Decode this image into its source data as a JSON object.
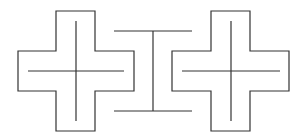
{
  "diagram": {
    "stroke_color": "#333333",
    "background": "#ffffff",
    "shapes": [
      {
        "type": "cross-outline",
        "name": "left-cross",
        "bbox": [
          18,
          11,
          134,
          131
        ],
        "arm_x": [
          56,
          95
        ],
        "arm_y": [
          51,
          91
        ],
        "inner_vertical": {
          "x": 76,
          "y1": 21,
          "y2": 121
        },
        "inner_horizontal": {
          "y": 71,
          "x1": 28,
          "x2": 124
        }
      },
      {
        "type": "i-beam",
        "name": "center-i-beam",
        "top_bar": {
          "y": 31,
          "x1": 114,
          "x2": 192
        },
        "bottom_bar": {
          "y": 111,
          "x1": 114,
          "x2": 192
        },
        "stem_x": 153
      },
      {
        "type": "cross-outline",
        "name": "right-cross",
        "bbox": [
          172,
          11,
          289,
          131
        ],
        "arm_x": [
          211,
          250
        ],
        "arm_y": [
          51,
          91
        ],
        "inner_vertical": {
          "x": 231,
          "y1": 21,
          "y2": 121
        },
        "inner_horizontal": {
          "y": 71,
          "x1": 182,
          "x2": 280
        }
      }
    ]
  }
}
